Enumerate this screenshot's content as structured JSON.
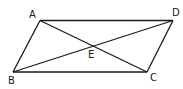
{
  "diagram": {
    "type": "parallelogram-with-diagonals",
    "points": {
      "A": {
        "x": 40,
        "y": 20.5
      },
      "B": {
        "x": 13,
        "y": 72
      },
      "C": {
        "x": 147,
        "y": 72
      },
      "D": {
        "x": 173,
        "y": 20.5
      },
      "E": {
        "x": 93,
        "y": 46
      }
    },
    "labels": {
      "A": {
        "text": "A",
        "x": 29,
        "y": 18
      },
      "B": {
        "text": "B",
        "x": 8,
        "y": 84
      },
      "C": {
        "text": "C",
        "x": 150,
        "y": 81
      },
      "D": {
        "text": "D",
        "x": 172,
        "y": 16
      },
      "E": {
        "text": "E",
        "x": 88,
        "y": 58
      }
    },
    "sides": [
      "AD",
      "DC",
      "CB",
      "BA"
    ],
    "diagonals": [
      "AC",
      "BD"
    ],
    "stroke_color": "#1a1a1a"
  }
}
